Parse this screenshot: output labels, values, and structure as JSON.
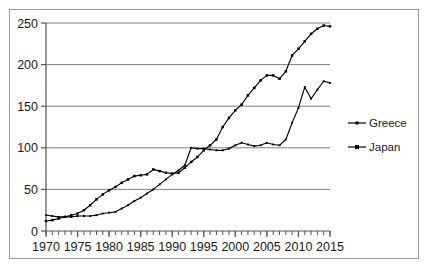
{
  "frame": {
    "border_color": "#9a9a9a",
    "background": "#ffffff"
  },
  "chart_data": {
    "type": "line",
    "title": "",
    "subtitle": "",
    "xlabel": "",
    "ylabel": "",
    "xlim": [
      1970,
      2015
    ],
    "ylim": [
      0,
      250
    ],
    "yticks": [
      0,
      50,
      100,
      150,
      200,
      250
    ],
    "ytick_labels": [
      "0",
      "50",
      "100",
      "150",
      "200",
      "250"
    ],
    "xticks": [
      1970,
      1975,
      1980,
      1985,
      1990,
      1995,
      2000,
      2005,
      2010,
      2015
    ],
    "xtick_labels": [
      "1970",
      "1975",
      "1980",
      "1985",
      "1990",
      "1995",
      "2000",
      "2005",
      "2010",
      "2015"
    ],
    "minor_xticks_every": 1,
    "grid": "horizontal",
    "grid_color": "#808080",
    "legend_position": "right",
    "marker": "square",
    "line_color": "#000000",
    "x": [
      1970,
      1971,
      1972,
      1973,
      1974,
      1975,
      1976,
      1977,
      1978,
      1979,
      1980,
      1981,
      1982,
      1983,
      1984,
      1985,
      1986,
      1987,
      1988,
      1989,
      1990,
      1991,
      1992,
      1993,
      1994,
      1995,
      1996,
      1997,
      1998,
      1999,
      2000,
      2001,
      2002,
      2003,
      2004,
      2005,
      2006,
      2007,
      2008,
      2009,
      2010,
      2011,
      2012,
      2013,
      2014,
      2015
    ],
    "series": [
      {
        "name": "Greece",
        "values": [
          19,
          18,
          17,
          17,
          17,
          18,
          18,
          18,
          19,
          21,
          22,
          23,
          27,
          31,
          36,
          40,
          45,
          50,
          56,
          62,
          68,
          73,
          79,
          100,
          99,
          99,
          98,
          97,
          97,
          99,
          103,
          106,
          104,
          102,
          103,
          106,
          104,
          103,
          110,
          130,
          148,
          173,
          159,
          170,
          180,
          178
        ]
      },
      {
        "name": "Japan",
        "values": [
          12,
          13,
          15,
          17,
          19,
          21,
          25,
          31,
          38,
          44,
          49,
          53,
          58,
          62,
          66,
          67,
          68,
          74,
          72,
          70,
          69,
          70,
          76,
          83,
          89,
          97,
          103,
          110,
          125,
          136,
          145,
          152,
          163,
          172,
          181,
          187,
          187,
          183,
          192,
          211,
          219,
          228,
          237,
          243,
          247,
          246
        ]
      }
    ]
  },
  "legend": {
    "items": [
      {
        "label": "Greece",
        "marker": "square"
      },
      {
        "label": "Japan",
        "marker": "square"
      }
    ]
  }
}
